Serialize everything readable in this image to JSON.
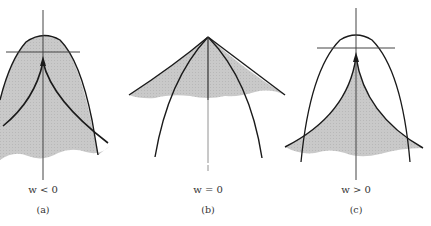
{
  "figure": {
    "panels": [
      {
        "id": "a",
        "condition": "w < 0",
        "caption": "(a)"
      },
      {
        "id": "b",
        "condition": "w = 0",
        "caption": "(b)"
      },
      {
        "id": "c",
        "condition": "w > 0",
        "caption": "(c)"
      }
    ],
    "colors": {
      "ink": "#1a1a1a",
      "shade": "#c4c4c4",
      "axis": "#555555"
    }
  }
}
